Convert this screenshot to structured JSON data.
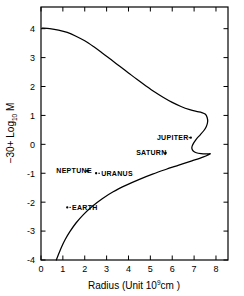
{
  "chart_data": {
    "type": "line",
    "title": "",
    "xlabel": "Radius (Unit 10⁹ cm)",
    "xlabel_parts": {
      "main": "Radius  (Unit 10",
      "exp": "9",
      "tail": "cm )"
    },
    "ylabel": "−30 + Log₁₀ M",
    "ylabel_parts": {
      "main": "−30+ Log",
      "sub": "10",
      "tail": "M"
    },
    "xlim": [
      0,
      8.55
    ],
    "ylim": [
      -4,
      4.75
    ],
    "xticks": [
      0,
      1,
      2,
      3,
      4,
      5,
      6,
      7,
      8
    ],
    "xticklabels": [
      "0",
      "1",
      "2",
      "3",
      "4",
      "5",
      "6",
      "7",
      "8"
    ],
    "yticks": [
      -4,
      -3,
      -2,
      -1,
      0,
      1,
      2,
      3,
      4
    ],
    "yticklabels": [
      "-4",
      "-3",
      "-2",
      "-1",
      "0",
      "1",
      "2",
      "3",
      "4"
    ],
    "grid": false,
    "legend": "none",
    "series": [
      {
        "name": "mass-radius relation",
        "comment": "upper branch descends from (0.05,4.02) rightward; turns at max radius ~7.62 near logM=1.0; recurves left to ~6.9 at logM=-0.1; small right hook to 7.75 at logM=-0.32; lower branch descends left to (0.70,-4)",
        "points": [
          [
            0.05,
            4.02
          ],
          [
            0.4,
            4.0
          ],
          [
            0.8,
            3.95
          ],
          [
            1.2,
            3.87
          ],
          [
            1.6,
            3.74
          ],
          [
            2.0,
            3.58
          ],
          [
            2.4,
            3.38
          ],
          [
            2.8,
            3.16
          ],
          [
            3.2,
            2.93
          ],
          [
            3.6,
            2.7
          ],
          [
            4.0,
            2.47
          ],
          [
            4.4,
            2.24
          ],
          [
            4.8,
            2.02
          ],
          [
            5.2,
            1.81
          ],
          [
            5.6,
            1.62
          ],
          [
            6.0,
            1.45
          ],
          [
            6.4,
            1.31
          ],
          [
            6.8,
            1.2
          ],
          [
            7.1,
            1.14
          ],
          [
            7.35,
            1.1
          ],
          [
            7.52,
            1.04
          ],
          [
            7.6,
            0.92
          ],
          [
            7.62,
            0.78
          ],
          [
            7.56,
            0.62
          ],
          [
            7.44,
            0.47
          ],
          [
            7.28,
            0.33
          ],
          [
            7.12,
            0.2
          ],
          [
            6.99,
            0.06
          ],
          [
            6.91,
            -0.06
          ],
          [
            6.9,
            -0.15
          ],
          [
            6.96,
            -0.23
          ],
          [
            7.1,
            -0.29
          ],
          [
            7.32,
            -0.32
          ],
          [
            7.56,
            -0.33
          ],
          [
            7.74,
            -0.33
          ],
          [
            7.4,
            -0.44
          ],
          [
            6.9,
            -0.57
          ],
          [
            6.3,
            -0.72
          ],
          [
            5.7,
            -0.87
          ],
          [
            5.1,
            -1.03
          ],
          [
            4.5,
            -1.21
          ],
          [
            3.9,
            -1.41
          ],
          [
            3.3,
            -1.64
          ],
          [
            2.8,
            -1.88
          ],
          [
            2.35,
            -2.14
          ],
          [
            1.95,
            -2.42
          ],
          [
            1.6,
            -2.72
          ],
          [
            1.32,
            -3.02
          ],
          [
            1.1,
            -3.3
          ],
          [
            0.94,
            -3.55
          ],
          [
            0.82,
            -3.77
          ],
          [
            0.74,
            -3.92
          ],
          [
            0.7,
            -4.0
          ]
        ]
      }
    ],
    "annotations": [
      {
        "id": "jupiter",
        "label": "JUPITER",
        "point_x": 6.85,
        "point_y": 0.23,
        "label_x": 5.3,
        "label_y": 0.23,
        "leader": "right"
      },
      {
        "id": "saturn",
        "label": "SATURN",
        "point_x": 5.7,
        "point_y": -0.3,
        "label_x": 4.35,
        "label_y": -0.3,
        "leader": "right"
      },
      {
        "id": "neptune",
        "label": "NEPTUNE",
        "point_x": 2.12,
        "point_y": -0.92,
        "label_x": 0.7,
        "label_y": -0.92,
        "leader": "right"
      },
      {
        "id": "uranus",
        "label": "URANUS",
        "point_x": 2.52,
        "point_y": -1.0,
        "label_x": 2.75,
        "label_y": -1.0,
        "leader": "left"
      },
      {
        "id": "earth",
        "label": "EARTH",
        "point_x": 1.2,
        "point_y": -2.18,
        "label_x": 1.42,
        "label_y": -2.18,
        "leader": "left"
      }
    ]
  }
}
